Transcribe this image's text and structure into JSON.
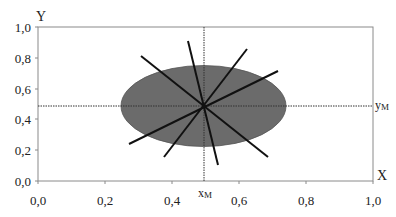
{
  "diagram": {
    "axes": {
      "x_label": "X",
      "y_label": "Y",
      "x_ticks": [
        "0,0",
        "0,2",
        "0,4",
        "0,6",
        "0,8",
        "1,0"
      ],
      "y_ticks": [
        "0,0",
        "0,2",
        "0,4",
        "0,6",
        "0,8",
        "1,0"
      ],
      "xlim": [
        0,
        1
      ],
      "ylim": [
        0,
        1
      ]
    },
    "center": {
      "x": 0.495,
      "y": 0.48
    },
    "center_labels": {
      "x": "x",
      "x_sub": "M",
      "y": "y",
      "y_sub": "M"
    },
    "ellipse": {
      "cx": 0.495,
      "cy": 0.48,
      "rx": 0.246,
      "ry": 0.263,
      "fill": "#6b6b6b"
    },
    "lines": [
      {
        "x1": 0.31,
        "y1": 0.81,
        "x2": 0.69,
        "y2": 0.16
      },
      {
        "x1": 0.45,
        "y1": 0.91,
        "x2": 0.54,
        "y2": 0.1
      },
      {
        "x1": 0.62,
        "y1": 0.86,
        "x2": 0.38,
        "y2": 0.16
      },
      {
        "x1": 0.72,
        "y1": 0.71,
        "x2": 0.27,
        "y2": 0.24
      }
    ],
    "colors": {
      "frame": "#888888",
      "line": "#111111",
      "ellipse": "#6b6b6b",
      "guide": "#333333"
    }
  }
}
